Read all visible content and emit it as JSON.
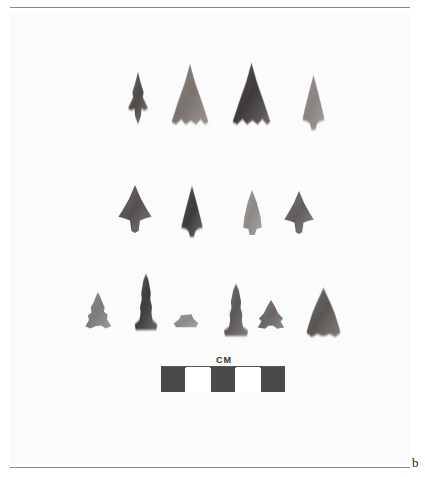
{
  "figure": {
    "panel_label": "b",
    "scale_bar": {
      "unit_label": "CM",
      "segments": [
        "dark",
        "light",
        "dark",
        "light",
        "dark"
      ]
    },
    "colors": {
      "background": "#ffffff",
      "plate": "#fbfbfb",
      "rule": "#8a8a8a",
      "scale_dark": "#4a4a4a"
    },
    "rows": [
      {
        "name": "row-1",
        "artifacts": [
          {
            "shape": "stemmed-small",
            "x": 120,
            "y": 72,
            "w": 36,
            "h": 52,
            "fill": "#4f4a47"
          },
          {
            "shape": "triangular-notched",
            "x": 168,
            "y": 64,
            "w": 44,
            "h": 63,
            "fill": "#7a726d"
          },
          {
            "shape": "triangular-notched",
            "x": 229,
            "y": 63,
            "w": 45,
            "h": 64,
            "fill": "#3e3a38"
          },
          {
            "shape": "stemmed-slender",
            "x": 298,
            "y": 75,
            "w": 31,
            "h": 55,
            "fill": "#8a837f"
          }
        ]
      },
      {
        "name": "row-2",
        "artifacts": [
          {
            "shape": "stemmed-broad",
            "x": 117,
            "y": 185,
            "w": 36,
            "h": 48,
            "fill": "#555050"
          },
          {
            "shape": "stemmed-slender",
            "x": 177,
            "y": 186,
            "w": 30,
            "h": 51,
            "fill": "#3d3a39"
          },
          {
            "shape": "stemmed-pale",
            "x": 239,
            "y": 190,
            "w": 27,
            "h": 45,
            "fill": "#8c8886"
          },
          {
            "shape": "stemmed-broad",
            "x": 283,
            "y": 191,
            "w": 32,
            "h": 43,
            "fill": "#625d5b"
          }
        ]
      },
      {
        "name": "row-3",
        "artifacts": [
          {
            "shape": "serrated-pale",
            "x": 83,
            "y": 292,
            "w": 30,
            "h": 38,
            "fill": "#7e7a78"
          },
          {
            "shape": "serrated-tall",
            "x": 131,
            "y": 274,
            "w": 30,
            "h": 56,
            "fill": "#3f3b3a"
          },
          {
            "shape": "fragment",
            "x": 172,
            "y": 312,
            "w": 28,
            "h": 16,
            "fill": "#8d8987"
          },
          {
            "shape": "serrated-tall",
            "x": 220,
            "y": 284,
            "w": 32,
            "h": 52,
            "fill": "#5c5856"
          },
          {
            "shape": "serrated-short",
            "x": 256,
            "y": 300,
            "w": 30,
            "h": 30,
            "fill": "#6a6563"
          },
          {
            "shape": "serrated-broad",
            "x": 305,
            "y": 288,
            "w": 37,
            "h": 50,
            "fill": "#5a5553"
          }
        ]
      }
    ]
  }
}
